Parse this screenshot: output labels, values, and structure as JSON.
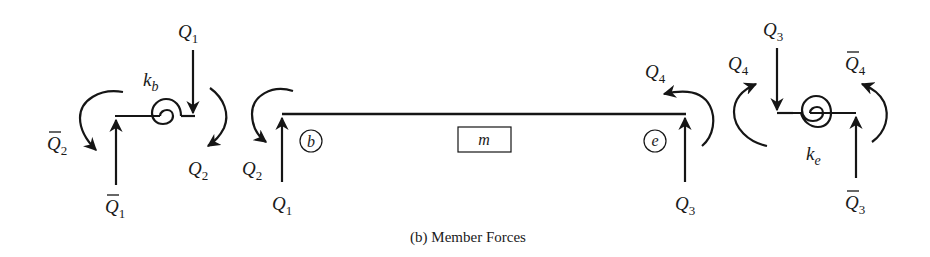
{
  "figure": {
    "caption": "(b) Member Forces",
    "colors": {
      "ink": "#151515",
      "background": "#ffffff"
    }
  },
  "left_spring": {
    "stiffness_label": "k",
    "stiffness_sub": "b",
    "labels": {
      "Q1_top": {
        "base": "Q",
        "sub": "1"
      },
      "Q2_right": {
        "base": "Q",
        "sub": "2"
      },
      "Qbar2_left": {
        "base": "Q",
        "sub": "2",
        "bar": true
      },
      "Qbar1_bottom": {
        "base": "Q",
        "sub": "1",
        "bar": true
      }
    }
  },
  "member": {
    "label": "m",
    "begin_node": "b",
    "end_node": "e",
    "labels": {
      "Q2_left": {
        "base": "Q",
        "sub": "2"
      },
      "Q1_left": {
        "base": "Q",
        "sub": "1"
      },
      "Q4_right": {
        "base": "Q",
        "sub": "4"
      },
      "Q3_right": {
        "base": "Q",
        "sub": "3"
      }
    }
  },
  "right_spring": {
    "stiffness_label": "k",
    "stiffness_sub": "e",
    "labels": {
      "Q3_top": {
        "base": "Q",
        "sub": "3"
      },
      "Q4_left": {
        "base": "Q",
        "sub": "4"
      },
      "Qbar4_right": {
        "base": "Q",
        "sub": "4",
        "bar": true
      },
      "Qbar3_bottom": {
        "base": "Q",
        "sub": "3",
        "bar": true
      }
    }
  }
}
